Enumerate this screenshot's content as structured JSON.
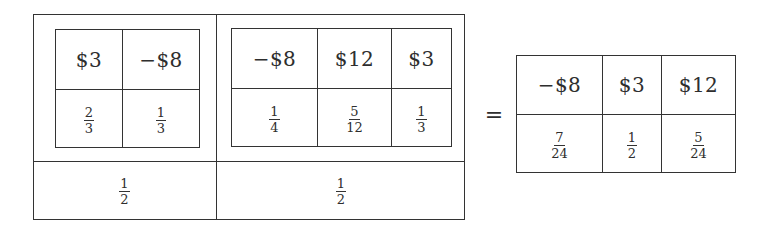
{
  "equation": {
    "left_composite": {
      "panels": [
        {
          "inner_table": {
            "values": [
              "$3",
              "−$8"
            ],
            "probabilities": [
              {
                "num": "2",
                "den": "3"
              },
              {
                "num": "1",
                "den": "3"
              }
            ]
          },
          "weight": {
            "num": "1",
            "den": "2"
          }
        },
        {
          "inner_table": {
            "values": [
              "−$8",
              "$12",
              "$3"
            ],
            "probabilities": [
              {
                "num": "1",
                "den": "4"
              },
              {
                "num": "5",
                "den": "12"
              },
              {
                "num": "1",
                "den": "3"
              }
            ]
          },
          "weight": {
            "num": "1",
            "den": "2"
          }
        }
      ]
    },
    "equals_sign": "=",
    "result_table": {
      "values": [
        "−$8",
        "$3",
        "$12"
      ],
      "probabilities": [
        {
          "num": "7",
          "den": "24"
        },
        {
          "num": "1",
          "den": "2"
        },
        {
          "num": "5",
          "den": "24"
        }
      ]
    }
  }
}
